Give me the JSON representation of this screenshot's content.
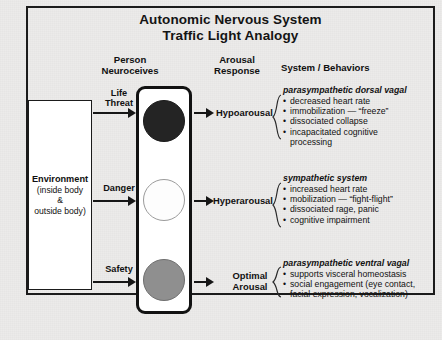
{
  "title": {
    "line1": "Autonomic Nervous System",
    "line2": "Traffic Light Analogy"
  },
  "columns": {
    "person": "Person\nNeuroceives",
    "person_line1": "Person",
    "person_line2": "Neuroceives",
    "arousal_line1": "Arousal",
    "arousal_line2": "Response",
    "system": "System / Behaviors"
  },
  "environment": {
    "title": "Environment",
    "sub1": "(inside body",
    "sub2": "&",
    "sub3": "outside body)"
  },
  "inputs": [
    {
      "label_line1": "Life",
      "label_line2": "Threat"
    },
    {
      "label_line1": "Danger",
      "label_line2": ""
    },
    {
      "label_line1": "Safety",
      "label_line2": ""
    }
  ],
  "lights": [
    {
      "name": "red-lamp",
      "color": "#242424"
    },
    {
      "name": "amber-lamp",
      "color": "#fdfdfd"
    },
    {
      "name": "green-lamp",
      "color": "#8f8f8f"
    }
  ],
  "arousal": [
    {
      "line1": "Hypoarousal",
      "line2": ""
    },
    {
      "line1": "Hyperarousal",
      "line2": ""
    },
    {
      "line1": "Optimal",
      "line2": "Arousal"
    }
  ],
  "systems": [
    {
      "title": "parasympathetic dorsal vagal",
      "items": [
        "decreased heart rate",
        "immobilization — “freeze”",
        "dissociated collapse",
        "incapacitated cognitive\n    processing"
      ]
    },
    {
      "title": "sympathetic system",
      "items": [
        "increased heart rate",
        "mobilization — “fight-flight”",
        "dissociated rage, panic",
        "cognitive impairment"
      ]
    },
    {
      "title": "parasympathetic ventral vagal",
      "items": [
        "supports visceral homeostasis",
        "social engagement (eye contact,\n    facial expression, vocalization)"
      ]
    }
  ],
  "colors": {
    "ink": "#141414",
    "paper": "#ecebea",
    "frame": "#1b1b1b"
  }
}
